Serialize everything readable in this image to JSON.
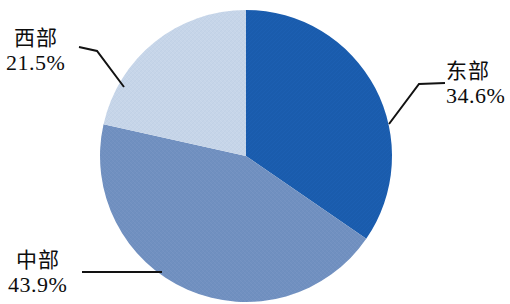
{
  "chart_data": {
    "type": "pie",
    "title": "",
    "categories": [
      "东部",
      "中部",
      "西部"
    ],
    "values": [
      34.6,
      43.9,
      21.5
    ],
    "unit": "%",
    "legend": "none",
    "labels_position": "outside-with-leader-lines",
    "start_angle_deg": 0,
    "direction": "clockwise",
    "slices": [
      {
        "name": "东部",
        "value": 34.6,
        "value_text": "34.6%",
        "color": "#1a5cad",
        "start_deg": 0.0,
        "end_deg": 124.56
      },
      {
        "name": "中部",
        "value": 43.9,
        "value_text": "43.9%",
        "color": "#7190c0",
        "start_deg": 124.56,
        "end_deg": 282.6
      },
      {
        "name": "西部",
        "value": 21.5,
        "value_text": "21.5%",
        "color": "#c6d5e8",
        "start_deg": 282.6,
        "end_deg": 360.0
      }
    ]
  },
  "labels": {
    "east": {
      "name": "东部",
      "value": "34.6%"
    },
    "middle": {
      "name": "中部",
      "value": "43.9%"
    },
    "west": {
      "name": "西部",
      "value": "21.5%"
    }
  },
  "colors": {
    "east": "#1a5cad",
    "middle": "#7190c0",
    "west": "#c6d5e8",
    "leader_line": "#121212",
    "background": "#ffffff",
    "text": "#0d0d0d"
  }
}
